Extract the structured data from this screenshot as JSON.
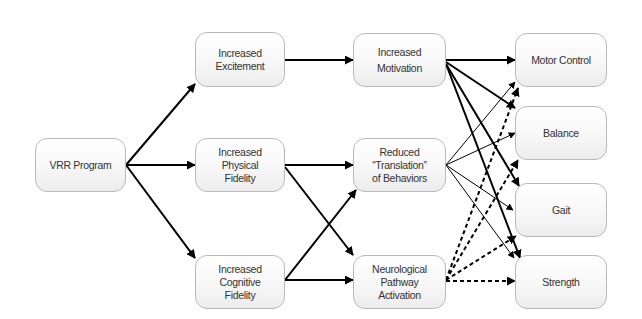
{
  "diagram": {
    "type": "flow-diagram",
    "nodes": {
      "vrr": {
        "label": "VRR Program"
      },
      "excitement": {
        "label": "Increased\nExcitement"
      },
      "physical": {
        "label": "Increased\nPhysical\nFidelity"
      },
      "cognitive": {
        "label": "Increased\nCognitive\nFidelity"
      },
      "motivation": {
        "label": "Increased\nMotivation"
      },
      "reduced": {
        "label": "Reduced\n“Translation”\nof Behaviors"
      },
      "neuro": {
        "label": "Neurological\nPathway\nActivation"
      },
      "motor": {
        "label": "Motor Control"
      },
      "balance": {
        "label": "Balance"
      },
      "gait": {
        "label": "Gait"
      },
      "strength": {
        "label": "Strength"
      }
    },
    "edges": [
      {
        "from": "vrr",
        "to": "excitement",
        "style": "solid-bold"
      },
      {
        "from": "vrr",
        "to": "physical",
        "style": "solid-bold"
      },
      {
        "from": "vrr",
        "to": "cognitive",
        "style": "solid-bold"
      },
      {
        "from": "excitement",
        "to": "motivation",
        "style": "solid-bold"
      },
      {
        "from": "physical",
        "to": "reduced",
        "style": "solid-bold"
      },
      {
        "from": "physical",
        "to": "neuro",
        "style": "solid-bold"
      },
      {
        "from": "cognitive",
        "to": "reduced",
        "style": "solid-bold"
      },
      {
        "from": "cognitive",
        "to": "neuro",
        "style": "solid-bold"
      },
      {
        "from": "motivation",
        "to": "motor",
        "style": "solid-bold"
      },
      {
        "from": "motivation",
        "to": "balance",
        "style": "solid-bold"
      },
      {
        "from": "motivation",
        "to": "gait",
        "style": "solid-bold"
      },
      {
        "from": "motivation",
        "to": "strength",
        "style": "solid-bold"
      },
      {
        "from": "reduced",
        "to": "motor",
        "style": "solid-thin"
      },
      {
        "from": "reduced",
        "to": "balance",
        "style": "solid-thin"
      },
      {
        "from": "reduced",
        "to": "gait",
        "style": "solid-thin"
      },
      {
        "from": "reduced",
        "to": "strength",
        "style": "solid-thin"
      },
      {
        "from": "neuro",
        "to": "motor",
        "style": "dashed"
      },
      {
        "from": "neuro",
        "to": "balance",
        "style": "dashed"
      },
      {
        "from": "neuro",
        "to": "gait",
        "style": "dashed"
      },
      {
        "from": "neuro",
        "to": "strength",
        "style": "dashed"
      }
    ],
    "colors": {
      "line": "#000000",
      "box_border": "#b9b9b9",
      "text": "#333333"
    }
  }
}
